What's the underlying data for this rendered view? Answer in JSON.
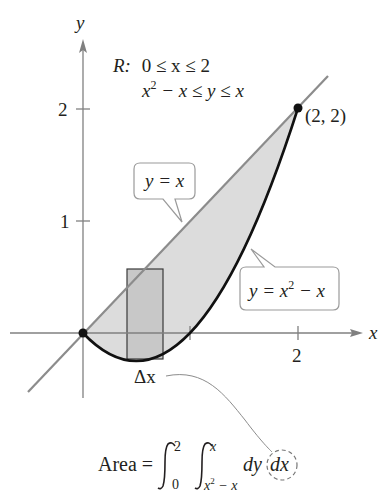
{
  "diagram": {
    "type": "double-integral-region",
    "axes": {
      "x_label": "x",
      "y_label": "y",
      "x_ticks": [
        {
          "value": 1,
          "label": ""
        },
        {
          "value": 2,
          "label": "2"
        }
      ],
      "y_ticks": [
        {
          "value": 1,
          "label": "1"
        },
        {
          "value": 2,
          "label": "2"
        }
      ]
    },
    "region_description": {
      "prefix": "R:",
      "line1": "0 ≤ x ≤ 2",
      "line2_base": "x",
      "line2_sup": "2",
      "line2_rest": " − x ≤ y ≤ x"
    },
    "point": {
      "label": "(2, 2)"
    },
    "callouts": {
      "line": {
        "text": "y = x"
      },
      "parabola": {
        "lhs": "y = x",
        "sup": "2",
        "rest": " − x"
      }
    },
    "strip": {
      "label": "Δx"
    },
    "formula": {
      "prefix": "Area =",
      "outer_upper": "2",
      "outer_lower": "0",
      "inner_upper": "x",
      "inner_lower_base": "x",
      "inner_lower_sup": "2",
      "inner_lower_rest": " − x",
      "integrand": "dy",
      "differential": "dx"
    },
    "colors": {
      "region_fill": "#dcdcdc",
      "strip_fill": "#c8c8c8",
      "axis": "#808080",
      "line_y_eq_x": "#8c8c8c",
      "parabola": "#111111",
      "text": "#231f20"
    }
  }
}
